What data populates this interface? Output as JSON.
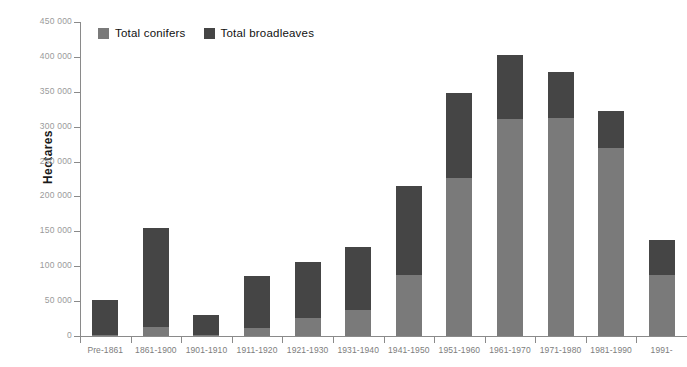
{
  "chart_data": {
    "type": "bar",
    "subtype": "stacked-vertical",
    "title": "",
    "xlabel": "",
    "ylabel": "Hectares",
    "ylim": [
      0,
      450000
    ],
    "ytick_step": 50000,
    "ytick_labels": [
      "450 000",
      "400 000",
      "350 000",
      "300 000",
      "250 000",
      "200 000",
      "150 000",
      "100 000",
      "50 000",
      "0"
    ],
    "ytick_values": [
      450000,
      400000,
      350000,
      300000,
      250000,
      200000,
      150000,
      100000,
      50000,
      0
    ],
    "grid": false,
    "legend_position": "top-left",
    "categories": [
      "Pre-1861",
      "1861-1900",
      "1901-1910",
      "1911-1920",
      "1921-1930",
      "1931-1940",
      "1941-1950",
      "1951-1960",
      "1961-1970",
      "1971-1980",
      "1981-1990",
      "1991-"
    ],
    "series": [
      {
        "name": "Total conifers",
        "color": "#7a7a7a",
        "values": [
          1000,
          13000,
          1000,
          11000,
          26000,
          38000,
          87000,
          227000,
          311000,
          313000,
          270000,
          87000
        ]
      },
      {
        "name": "Total broadleaves",
        "color": "#454545",
        "values": [
          51000,
          142000,
          29000,
          75000,
          80000,
          89000,
          128000,
          121000,
          92000,
          66000,
          53000,
          51000
        ]
      }
    ],
    "totals": [
      52000,
      155000,
      30000,
      86000,
      106000,
      127000,
      215000,
      348000,
      403000,
      379000,
      323000,
      138000
    ]
  },
  "legend": {
    "items": [
      {
        "label": "Total conifers",
        "color": "#7a7a7a",
        "icon": "square-swatch-icon"
      },
      {
        "label": "Total broadleaves",
        "color": "#454545",
        "icon": "square-swatch-icon"
      }
    ]
  },
  "axes": {
    "y_title": "Hectares"
  }
}
